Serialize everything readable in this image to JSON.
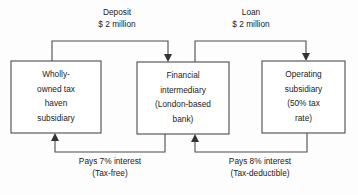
{
  "diagram": {
    "style": {
      "background": "#fdfdfd",
      "line_color": "#4c4c4c",
      "arrow_color": "#333333",
      "text_color": "#1b1b1b",
      "box_fill": "#ffffff"
    },
    "nodes": [
      {
        "id": "tax-haven-subsidiary",
        "lines": [
          "Wholly-",
          "owned tax",
          "haven",
          "subsidiary"
        ],
        "x": 11,
        "y": 61,
        "w": 90,
        "h": 72
      },
      {
        "id": "financial-intermediary",
        "lines": [
          "Financial",
          "intermediary",
          "(London-based",
          "bank)"
        ],
        "x": 137,
        "y": 62,
        "w": 92,
        "h": 72
      },
      {
        "id": "operating-subsidiary",
        "lines": [
          "Operating",
          "subsidiary",
          "(50% tax",
          "rate)"
        ],
        "x": 262,
        "y": 61,
        "w": 83,
        "h": 72
      }
    ],
    "edges": [
      {
        "id": "deposit-edge",
        "label_lines": [
          "Deposit",
          "$ 2 million"
        ],
        "label_x": 117,
        "label_y": 13,
        "path": "M 52 61 L 52 41 L 168 41 L 168 55",
        "arrow": {
          "x": 168,
          "y": 62,
          "dir": "down"
        }
      },
      {
        "id": "loan-edge",
        "label_lines": [
          "Loan",
          "$ 2 million"
        ],
        "label_x": 251,
        "label_y": 13,
        "path": "M 195 62 L 195 41 L 306 41 L 306 54",
        "arrow": {
          "x": 306,
          "y": 61,
          "dir": "down"
        }
      },
      {
        "id": "interest-7-edge",
        "label_lines": [
          "Pays 7% interest",
          "(Tax-free)"
        ],
        "label_x": 110,
        "label_y": 162,
        "path": "M 165 134 L 165 152 L 55 152 L 55 140",
        "arrow": {
          "x": 55,
          "y": 133,
          "dir": "up"
        }
      },
      {
        "id": "interest-8-edge",
        "label_lines": [
          "Pays 8% interest",
          "(Tax-deductible)"
        ],
        "label_x": 260,
        "label_y": 162,
        "path": "M 307 133 L 307 152 L 195 152 L 195 141",
        "arrow": {
          "x": 195,
          "y": 134,
          "dir": "up"
        }
      }
    ]
  }
}
